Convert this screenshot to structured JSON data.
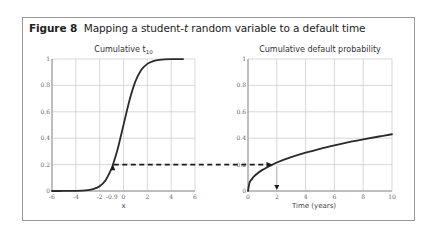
{
  "figure": {
    "label": "Figure 8",
    "title_pre": "Mapping a student-",
    "title_italic": "t",
    "title_post": " random variable to a default time"
  },
  "chart_data": [
    {
      "type": "line",
      "title": "Cumulative t",
      "title_subscript": "10",
      "xlabel": "x",
      "ylabel": "",
      "xlim": [
        -6,
        6
      ],
      "ylim": [
        0,
        1
      ],
      "grid": true,
      "x_ticks": [
        "-6",
        "-4",
        "-2",
        "-0.9",
        "0",
        "2",
        "4",
        "6"
      ],
      "x_tick_values": [
        -6,
        -4,
        -2,
        -0.9,
        0,
        2,
        4,
        6
      ],
      "y_ticks": [
        "0",
        "0.2",
        "0.4",
        "0.6",
        "0.8",
        "1"
      ],
      "y_tick_values": [
        0,
        0.2,
        0.4,
        0.6,
        0.8,
        1
      ],
      "series": [
        {
          "name": "Cumulative t10",
          "x": [
            -6,
            -5,
            -4,
            -3,
            -2.5,
            -2,
            -1.5,
            -1,
            -0.9,
            -0.5,
            0,
            0.5,
            1,
            1.5,
            2,
            2.5,
            3,
            4,
            5
          ],
          "y": [
            0.0001,
            0.0003,
            0.0013,
            0.0067,
            0.0157,
            0.0367,
            0.082,
            0.17,
            0.195,
            0.314,
            0.5,
            0.686,
            0.83,
            0.918,
            0.963,
            0.984,
            0.993,
            0.9987,
            0.9997
          ]
        }
      ],
      "annotations": [
        {
          "type": "arrow",
          "x": -0.9,
          "y": 0.195,
          "direction": "up",
          "label": "-0.9"
        },
        {
          "type": "dashed-line",
          "from_x": -0.9,
          "y": 0.2,
          "to": "right-chart"
        }
      ]
    },
    {
      "type": "line",
      "title": "Cumulative default probability",
      "xlabel": "Time (years)",
      "ylabel": "",
      "xlim": [
        0,
        10
      ],
      "ylim": [
        0,
        1
      ],
      "grid": true,
      "x_ticks": [
        "0",
        "2",
        "4",
        "6",
        "8",
        "10"
      ],
      "x_tick_values": [
        0,
        2,
        4,
        6,
        8,
        10
      ],
      "y_ticks": [
        "0",
        "0.2",
        "0.4",
        "0.6",
        "0.8",
        "1"
      ],
      "y_tick_values": [
        0,
        0.2,
        0.4,
        0.6,
        0.8,
        1
      ],
      "series": [
        {
          "name": "Cumulative default probability",
          "x": [
            0,
            0.1,
            0.25,
            0.5,
            1,
            1.7,
            2,
            3,
            4,
            5,
            6,
            7,
            8,
            9,
            10
          ],
          "y": [
            0,
            0.06,
            0.088,
            0.119,
            0.16,
            0.2,
            0.216,
            0.256,
            0.29,
            0.32,
            0.346,
            0.37,
            0.391,
            0.411,
            0.43
          ]
        }
      ],
      "annotations": [
        {
          "type": "arrow",
          "x": 1.7,
          "y": 0.2,
          "direction": "right",
          "label": ""
        },
        {
          "type": "arrow",
          "x": 2,
          "y": 0,
          "direction": "down",
          "label": ""
        }
      ]
    }
  ],
  "colors": {
    "curve": "#2a2a2a",
    "grid": "#c8c8c8",
    "axis": "#888888",
    "frame": "#9a9a9a",
    "dashed": "#1a1a1a"
  }
}
